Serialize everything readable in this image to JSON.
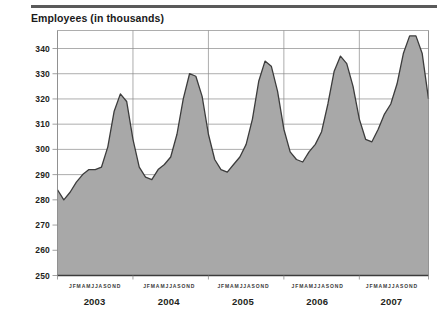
{
  "chart_title": "Employees (in thousands)",
  "chart_data": {
    "type": "area",
    "title": "Employees (in thousands)",
    "xlabel": "",
    "ylabel": "Employees (in thousands)",
    "ylim": [
      250,
      347
    ],
    "grid": true,
    "legend": null,
    "y_ticks": [
      250,
      260,
      270,
      280,
      290,
      300,
      310,
      320,
      330,
      340
    ],
    "month_letters": [
      "J",
      "F",
      "M",
      "A",
      "M",
      "J",
      "J",
      "A",
      "S",
      "O",
      "N",
      "D"
    ],
    "month_letters_string": "JFMAMJJASOND",
    "years": [
      "2003",
      "2004",
      "2005",
      "2006",
      "2007"
    ],
    "x": [
      "2003-01",
      "2003-02",
      "2003-03",
      "2003-04",
      "2003-05",
      "2003-06",
      "2003-07",
      "2003-08",
      "2003-09",
      "2003-10",
      "2003-11",
      "2003-12",
      "2004-01",
      "2004-02",
      "2004-03",
      "2004-04",
      "2004-05",
      "2004-06",
      "2004-07",
      "2004-08",
      "2004-09",
      "2004-10",
      "2004-11",
      "2004-12",
      "2005-01",
      "2005-02",
      "2005-03",
      "2005-04",
      "2005-05",
      "2005-06",
      "2005-07",
      "2005-08",
      "2005-09",
      "2005-10",
      "2005-11",
      "2005-12",
      "2006-01",
      "2006-02",
      "2006-03",
      "2006-04",
      "2006-05",
      "2006-06",
      "2006-07",
      "2006-08",
      "2006-09",
      "2006-10",
      "2006-11",
      "2006-12",
      "2007-01",
      "2007-02",
      "2007-03",
      "2007-04",
      "2007-05",
      "2007-06",
      "2007-07",
      "2007-08",
      "2007-09",
      "2007-10",
      "2007-11",
      "2007-12"
    ],
    "values": [
      284,
      280,
      283,
      287,
      290,
      292,
      292,
      293,
      301,
      315,
      322,
      319,
      304,
      293,
      289,
      288,
      292,
      294,
      297,
      306,
      320,
      330,
      329,
      321,
      306,
      296,
      292,
      291,
      294,
      297,
      302,
      312,
      327,
      335,
      333,
      323,
      308,
      299,
      296,
      295,
      299,
      302,
      307,
      318,
      331,
      337,
      334,
      325,
      312,
      304,
      303,
      308,
      314,
      318,
      326,
      338,
      345,
      345,
      338,
      320
    ]
  },
  "series_style": {
    "fill": "#a8a8a8",
    "line": "#3c3c3c",
    "grid": "#8a8a8a",
    "axis": "#4a4a4a",
    "rule": "#5a5a5a"
  }
}
